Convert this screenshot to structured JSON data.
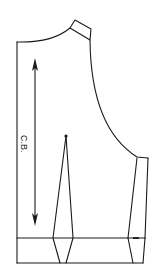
{
  "diagram": {
    "type": "sewing pattern piece",
    "labels": {
      "grainline": "C.B."
    },
    "colors": {
      "line": "#1a1a1a",
      "background": "#ffffff"
    },
    "elements": [
      {
        "name": "center-back-edge",
        "kind": "line"
      },
      {
        "name": "neckline",
        "kind": "curve"
      },
      {
        "name": "shoulder-strap",
        "kind": "quadrilateral"
      },
      {
        "name": "armhole",
        "kind": "curve"
      },
      {
        "name": "side-panel",
        "kind": "quadrilateral"
      },
      {
        "name": "waist-dart",
        "kind": "dart",
        "apex_marker": "dot"
      },
      {
        "name": "waistband",
        "kind": "band"
      },
      {
        "name": "grainline-arrow",
        "kind": "double-arrow",
        "label": "C.B."
      }
    ]
  }
}
